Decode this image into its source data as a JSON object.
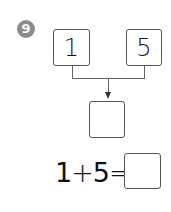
{
  "problem": {
    "number": "9",
    "badge_color": "#8c8c8c",
    "addends": [
      "1",
      "5"
    ],
    "sum_box": "",
    "equation": {
      "left": "1",
      "operator": "+",
      "right": "5",
      "equals": "=",
      "answer": ""
    }
  }
}
